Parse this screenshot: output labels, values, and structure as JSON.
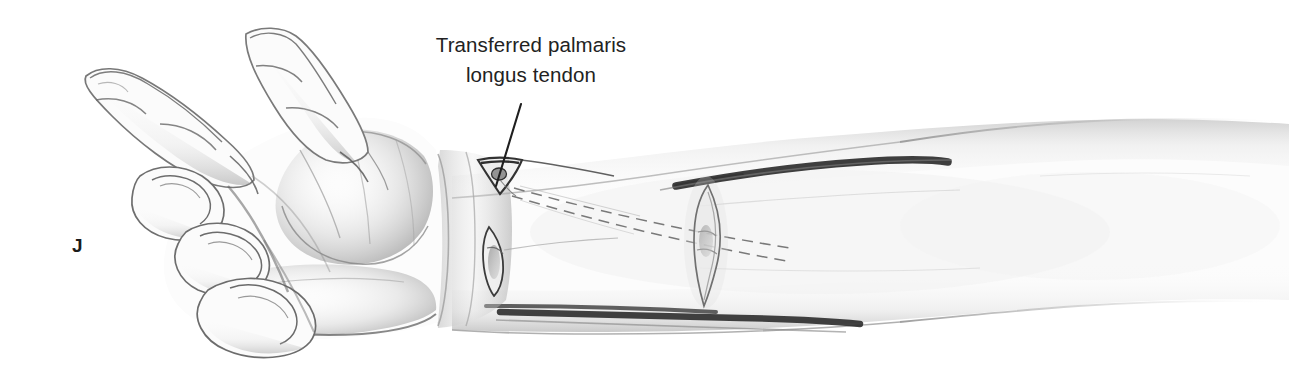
{
  "figure": {
    "panel_letter": "J",
    "background_color": "#ffffff",
    "ink_color": "#2b2b2b",
    "shade_color": "#9a9a9a",
    "width": 1289,
    "height": 386
  },
  "callout": {
    "line1": "Transferred palmaris",
    "line2": "longus tendon",
    "leader_from": "521,104",
    "leader_to": "496,186"
  },
  "anatomy": {
    "hand_label": "hand",
    "thumb_label": "thumb",
    "index_finger_label": "index finger",
    "fingers_label": "flexed fingers",
    "thenar_label": "thenar eminence",
    "wrist_label": "wrist",
    "forearm_label": "forearm"
  },
  "surgical": {
    "distal_incision_label": "distal wrist incision",
    "second_wrist_incision_label": "second wrist incision",
    "midforearm_incision_label": "mid-forearm elliptical incision",
    "tendon_path_label": "subcutaneous tendon tunnel path",
    "proximal_skin_crease_label": "proximal forearm skin crease",
    "distal_skin_crease_label": "distal forearm skin crease"
  }
}
